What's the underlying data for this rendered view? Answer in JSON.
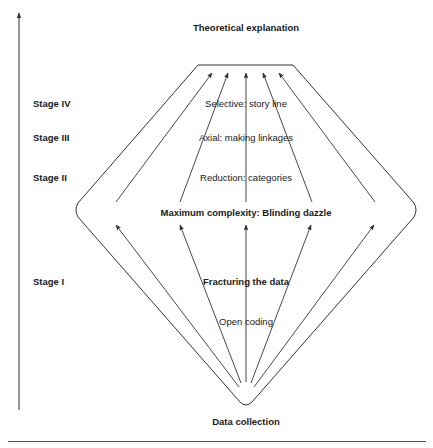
{
  "diagram": {
    "title_top": "Theoretical explanation",
    "title_bottom": "Data collection",
    "middle_label": "Maximum complexity: Blinding dazzle",
    "stages": [
      {
        "label": "Stage IV",
        "description": "Selective: story line"
      },
      {
        "label": "Stage III",
        "description": "Axial: making linkages"
      },
      {
        "label": "Stage II",
        "description": "Reduction: categories"
      },
      {
        "label": "Stage I",
        "description": "Fracturing the data",
        "sub_description": "Open coding"
      }
    ],
    "colors": {
      "line": "#333333",
      "text": "#1a1a1a",
      "background": "#ffffff"
    }
  }
}
